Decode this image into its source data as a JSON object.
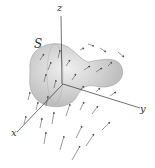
{
  "figure": {
    "surface_label": "S",
    "axes": {
      "x": "x",
      "y": "y",
      "z": "z"
    }
  },
  "colors": {
    "surface": "#c8c8c8",
    "surface_edge": "#999999",
    "axis": "#333333",
    "arrow": "#555555"
  }
}
